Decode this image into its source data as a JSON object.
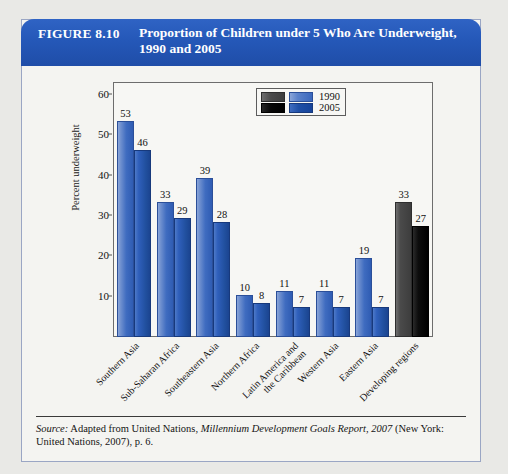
{
  "figure": {
    "label": "FIGURE 8.10",
    "title_line1": "Proportion of Children under 5 Who Are Underweight,",
    "title_line2": "1990 and 2005",
    "header_color": "#2558b8"
  },
  "source": {
    "prefix": "Source:",
    "text_before_italic": " Adapted from United Nations, ",
    "italic_title": "Millennium Development Goals Report, 2007",
    "text_after_italic": " (New York: United Nations, 2007), p. 6."
  },
  "legend": {
    "entries": [
      {
        "label": "1990",
        "blue_color": "#3b68bd",
        "dark_color": "#4a4a4a"
      },
      {
        "label": "2005",
        "blue_color": "#1f4fa6",
        "dark_color": "#000000"
      }
    ]
  },
  "chart_data": {
    "type": "bar",
    "title": "Proportion of Children under 5 Who Are Underweight, 1990 and 2005",
    "xlabel": "",
    "ylabel": "Percent underweight",
    "ylim": [
      0,
      63
    ],
    "yticks": [
      10,
      20,
      30,
      40,
      50,
      60
    ],
    "grid": false,
    "legend_position": "top-right",
    "categories": [
      "Southern Asia",
      "Sub-Saharan Africa",
      "Southeastern Asia",
      "Northern Africa",
      "Latin America and\nthe Caribbean",
      "Western Asia",
      "Eastern Asia",
      "Developing regions"
    ],
    "category_lines": [
      [
        "Southern Asia"
      ],
      [
        "Sub-Saharan Africa"
      ],
      [
        "Southeastern Asia"
      ],
      [
        "Northern Africa"
      ],
      [
        "Latin America and",
        "the Caribbean"
      ],
      [
        "Western Asia"
      ],
      [
        "Eastern Asia"
      ],
      [
        "Developing regions"
      ]
    ],
    "series": [
      {
        "name": "1990",
        "values": [
          53,
          33,
          39,
          10,
          11,
          11,
          19,
          33
        ]
      },
      {
        "name": "2005",
        "values": [
          46,
          29,
          28,
          8,
          7,
          7,
          7,
          27
        ]
      }
    ],
    "highlight_category_index": 7,
    "highlight_note": "Developing regions plotted in grey/black rather than blue"
  }
}
